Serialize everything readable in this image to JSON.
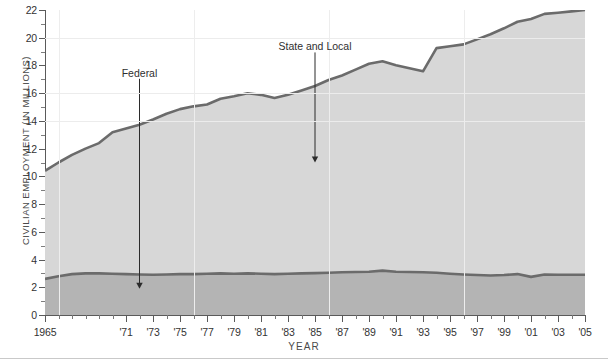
{
  "chart_data": {
    "type": "area",
    "title": "",
    "xlabel": "YEAR",
    "ylabel": "CIVILIAN EMPLOYMENT (IN MILLIONS)",
    "stacked": true,
    "grid": true,
    "legend_position": "inline-annotations",
    "xlim": [
      1965,
      2005
    ],
    "ylim": [
      0,
      22
    ],
    "ytick_step": 2,
    "yticks": [
      0,
      2,
      4,
      6,
      8,
      10,
      12,
      14,
      16,
      18,
      20,
      22
    ],
    "x": [
      1965,
      1966,
      1967,
      1968,
      1969,
      1970,
      1971,
      1972,
      1973,
      1974,
      1975,
      1976,
      1977,
      1978,
      1979,
      1980,
      1981,
      1982,
      1983,
      1984,
      1985,
      1986,
      1987,
      1988,
      1989,
      1990,
      1991,
      1992,
      1993,
      1994,
      1995,
      1996,
      1997,
      1998,
      1999,
      2000,
      2001,
      2002,
      2003,
      2004,
      2005
    ],
    "xtick_labels": [
      "1965",
      "'71",
      "'73",
      "'75",
      "'77",
      "'79",
      "'81",
      "'83",
      "'85",
      "'87",
      "'89",
      "'91",
      "'93",
      "'95",
      "'97",
      "'99",
      "'01",
      "'03",
      "'05"
    ],
    "xtick_years": [
      1965,
      1971,
      1973,
      1975,
      1977,
      1979,
      1981,
      1983,
      1985,
      1987,
      1989,
      1991,
      1993,
      1995,
      1997,
      1999,
      2001,
      2003,
      2005
    ],
    "series": [
      {
        "name": "Federal",
        "color": "#b4b4b4",
        "line_color": "#6b6b6b",
        "values": [
          2.6,
          2.8,
          2.95,
          3.0,
          3.0,
          2.98,
          2.95,
          2.92,
          2.9,
          2.92,
          2.95,
          2.95,
          2.98,
          3.0,
          2.98,
          3.0,
          2.98,
          2.95,
          2.98,
          3.0,
          3.02,
          3.05,
          3.08,
          3.1,
          3.12,
          3.2,
          3.12,
          3.1,
          3.08,
          3.05,
          2.98,
          2.92,
          2.88,
          2.85,
          2.88,
          2.95,
          2.75,
          2.92,
          2.9,
          2.9,
          2.9
        ]
      },
      {
        "name": "State and Local",
        "color": "#d7d7d7",
        "line_color": "#6b6b6b",
        "values": [
          7.8,
          8.2,
          8.6,
          9.0,
          9.4,
          10.2,
          10.5,
          10.8,
          11.2,
          11.6,
          11.9,
          12.1,
          12.2,
          12.6,
          12.8,
          13.0,
          12.9,
          12.7,
          12.9,
          13.2,
          13.5,
          13.9,
          14.2,
          14.6,
          15.0,
          15.1,
          14.9,
          14.7,
          14.5,
          16.2,
          16.4,
          16.6,
          17.0,
          17.4,
          17.8,
          18.2,
          18.6,
          18.8,
          18.9,
          19.0,
          19.1
        ]
      }
    ],
    "total_values": [
      10.4,
      11.0,
      11.55,
      12.0,
      12.4,
      13.18,
      13.45,
      13.72,
      14.1,
      14.52,
      14.85,
      15.05,
      15.18,
      15.6,
      15.78,
      16.0,
      15.88,
      15.65,
      15.88,
      16.2,
      16.52,
      16.95,
      17.28,
      17.7,
      18.12,
      18.3,
      18.02,
      17.8,
      17.58,
      19.25,
      19.38,
      19.52,
      19.88,
      20.25,
      20.68,
      21.15,
      21.35,
      21.72,
      21.8,
      21.9,
      22.0
    ],
    "annotations": [
      {
        "text": "Federal",
        "year": 1972,
        "label_value": 17.4,
        "arrow_to_value": 1.9
      },
      {
        "text": "State and Local",
        "year": 1985,
        "label_value": 19.3,
        "arrow_to_value": 11.0
      }
    ]
  }
}
